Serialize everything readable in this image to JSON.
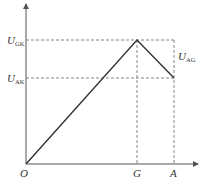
{
  "diagram": {
    "type": "voltage-position graph",
    "origin_label": "O",
    "x_ticks": [
      {
        "label": "G",
        "x": 137
      },
      {
        "label": "A",
        "x": 174
      }
    ],
    "y_levels": [
      {
        "label_main": "U",
        "label_sub": "GK",
        "y": 40
      },
      {
        "label_main": "U",
        "label_sub": "AK",
        "y": 78
      }
    ],
    "annotation": {
      "label_main": "U",
      "label_sub": "AG"
    },
    "polyline": [
      [
        26,
        164
      ],
      [
        137,
        40
      ],
      [
        174,
        78
      ]
    ],
    "colors": {
      "line": "#333333",
      "axis": "#555555",
      "dash": "#666666"
    }
  }
}
